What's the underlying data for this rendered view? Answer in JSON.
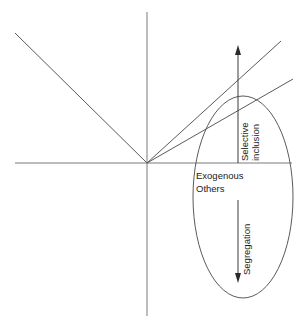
{
  "diagram": {
    "background_color": "#ffffff",
    "line_color": "#5a5a5a",
    "axis_color": "#7a7a7a",
    "arrow_color": "#2a2a2a",
    "text_color": "#1a1a1a",
    "origin": {
      "x": 147,
      "y": 163
    },
    "axes": {
      "horizontal": {
        "x1": 15,
        "y1": 163,
        "x2": 292,
        "y2": 163
      },
      "vertical": {
        "x1": 147,
        "y1": 12,
        "x2": 147,
        "y2": 316
      }
    },
    "rays": [
      {
        "name": "upper-left-ray",
        "x1": 147,
        "y1": 163,
        "x2": 15,
        "y2": 33
      },
      {
        "name": "upper-right-steep-ray",
        "x1": 147,
        "y1": 163,
        "x2": 281,
        "y2": 41
      },
      {
        "name": "upper-right-shallow-ray",
        "x1": 147,
        "y1": 163,
        "x2": 293,
        "y2": 79
      }
    ],
    "ellipse": {
      "name": "exogenous-others-region",
      "cx": 243,
      "cy": 197,
      "rx": 50,
      "ry": 101
    },
    "arrows": [
      {
        "name": "selective-inclusion-arrow",
        "label": "Selective inclusion",
        "label_lines": [
          "Selective",
          "inclusion"
        ],
        "direction": "up",
        "x": 238,
        "y_start": 163,
        "y_end": 47
      },
      {
        "name": "segregation-arrow",
        "label": "Segregation",
        "label_lines": [
          "Segregation"
        ],
        "direction": "down",
        "x": 238,
        "y_start": 200,
        "y_end": 282
      }
    ],
    "labels": {
      "region_label_line1": "Exogenous",
      "region_label_line2": "Others",
      "selective_inclusion_line1": "Selective",
      "selective_inclusion_line2": "inclusion",
      "segregation": "Segregation"
    }
  }
}
